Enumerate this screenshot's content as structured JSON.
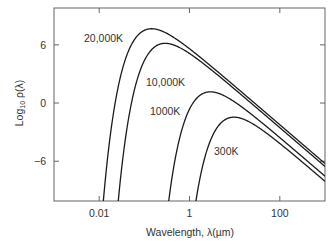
{
  "chart_data": {
    "type": "line",
    "title": "",
    "xlabel": "Wavelength, λ(µm)",
    "ylabel_main": "Log",
    "ylabel_sub": "10",
    "ylabel_tail": " ρ(λ)",
    "xscale": "log",
    "xlim": [
      0.001,
      1000
    ],
    "ylim": [
      -10.1,
      9.8
    ],
    "x_ticks": [
      {
        "value": 0.01,
        "label": "0.01"
      },
      {
        "value": 1,
        "label": "1"
      },
      {
        "value": 100,
        "label": "100"
      }
    ],
    "y_ticks": [
      {
        "value": 6,
        "label": "6"
      },
      {
        "value": 0,
        "label": "0"
      },
      {
        "value": -6,
        "label": "−6"
      }
    ],
    "grid": false,
    "legend": "inline labels",
    "model": {
      "formula": "log10( λ^-5 / (exp(C2/(λT)) - 1) ) + offset",
      "C2_um_K": 14388,
      "offset": 5.62
    },
    "series": [
      {
        "name": "20,000K",
        "T": 20000,
        "label_pos": [
          84,
          42
        ],
        "points": [
          [
            0.0316,
            3.24
          ],
          [
            0.1,
            7.5
          ],
          [
            0.145,
            7.66
          ],
          [
            0.316,
            7.18
          ],
          [
            1,
            5.6
          ],
          [
            3.16,
            3.71
          ],
          [
            10,
            1.75
          ],
          [
            31.6,
            -0.24
          ],
          [
            100,
            -2.24
          ],
          [
            316,
            -4.24
          ],
          [
            1000,
            -6.24
          ]
        ]
      },
      {
        "name": "10,000K",
        "T": 10000,
        "label_pos": [
          146,
          86
        ],
        "points": [
          [
            0.0316,
            -6.64
          ],
          [
            0.1,
            4.37
          ],
          [
            0.29,
            6.15
          ],
          [
            0.316,
            6.15
          ],
          [
            1,
            5.11
          ],
          [
            3.16,
            3.36
          ],
          [
            10,
            1.43
          ],
          [
            31.6,
            -0.55
          ],
          [
            100,
            -2.54
          ],
          [
            316,
            -4.54
          ],
          [
            1000,
            -6.54
          ]
        ]
      },
      {
        "name": "1000K",
        "T": 1000,
        "label_pos": [
          150,
          115
        ],
        "points": [
          [
            0.5,
            -5.37
          ],
          [
            1,
            -0.63
          ],
          [
            2.9,
            1.15
          ],
          [
            3.16,
            1.15
          ],
          [
            10,
            0.11
          ],
          [
            31.6,
            -1.64
          ],
          [
            100,
            -3.57
          ],
          [
            316,
            -5.55
          ],
          [
            1000,
            -7.54
          ]
        ]
      },
      {
        "name": "300K",
        "T": 300,
        "label_pos": [
          214,
          155
        ],
        "points": [
          [
            1.41,
            -9.9
          ],
          [
            1.78,
            -7.33
          ],
          [
            3.16,
            -3.47
          ],
          [
            5.62,
            -1.83
          ],
          [
            9.66,
            -1.46
          ],
          [
            10,
            -1.46
          ],
          [
            31.6,
            -2.43
          ],
          [
            100,
            -4.17
          ],
          [
            316,
            -6.09
          ],
          [
            1000,
            -8.07
          ]
        ]
      }
    ]
  }
}
